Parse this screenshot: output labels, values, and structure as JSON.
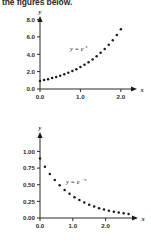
{
  "caption": {
    "text": "the figures below."
  },
  "figures": [
    {
      "id": "exp-growth",
      "y_axis_name": "y",
      "x_axis_name": "x",
      "equation_base": "y = e",
      "equation_exponent": "x"
    },
    {
      "id": "exp-decay",
      "y_axis_name": "y",
      "x_axis_name": "x",
      "equation_base": "y = e",
      "equation_exponent": "−x"
    }
  ],
  "chart_data": [
    {
      "type": "scatter",
      "title": "",
      "subtitle": "",
      "xlabel": "x",
      "ylabel": "y",
      "annotation": "y = e^x",
      "xlim": [
        0.0,
        2.3
      ],
      "ylim": [
        0.0,
        8.6
      ],
      "xticks": [
        0.0,
        1.0,
        2.0
      ],
      "xtick_labels": [
        "0.0",
        "1.0",
        "2.0"
      ],
      "yticks": [
        0.0,
        2.0,
        4.0,
        6.0,
        8.0
      ],
      "ytick_labels": [
        "0.0",
        "2.0",
        "4.0",
        "6.0",
        "8.0"
      ],
      "grid": false,
      "legend": "none",
      "marker": "circle",
      "marker_color": "#1b1b1b",
      "series": [
        {
          "name": "y = e^x",
          "x": [
            0.0,
            0.1,
            0.2,
            0.3,
            0.4,
            0.5,
            0.6,
            0.7,
            0.8,
            0.9,
            1.0,
            1.1,
            1.2,
            1.3,
            1.4,
            1.5,
            1.6,
            1.7,
            1.8,
            1.9,
            2.0
          ],
          "y": [
            1.0,
            1.11,
            1.22,
            1.35,
            1.49,
            1.65,
            1.82,
            2.01,
            2.23,
            2.46,
            2.72,
            3.0,
            3.32,
            3.67,
            4.06,
            4.48,
            4.95,
            5.47,
            6.05,
            6.69,
            7.39
          ]
        }
      ]
    },
    {
      "type": "scatter",
      "title": "",
      "subtitle": "",
      "xlabel": "x",
      "ylabel": "y",
      "annotation": "y = e^-x",
      "xlim": [
        0.0,
        2.85
      ],
      "ylim": [
        0.0,
        1.12
      ],
      "xticks": [
        0.0,
        1.0,
        2.0
      ],
      "xtick_labels": [
        "0.0",
        "1.0",
        "2.0"
      ],
      "yticks": [
        0.0,
        0.25,
        0.5,
        0.75,
        1.0
      ],
      "ytick_labels": [
        "0.00",
        "0.25",
        "0.50",
        "0.75",
        "1.00"
      ],
      "grid": false,
      "legend": "none",
      "marker": "circle",
      "marker_color": "#1b1b1b",
      "series": [
        {
          "name": "y = e^-x",
          "x": [
            0.0,
            0.15,
            0.3,
            0.45,
            0.6,
            0.75,
            0.9,
            1.05,
            1.2,
            1.35,
            1.5,
            1.65,
            1.8,
            1.95,
            2.1,
            2.25,
            2.4,
            2.55,
            2.7
          ],
          "y": [
            1.0,
            0.861,
            0.741,
            0.638,
            0.549,
            0.472,
            0.407,
            0.35,
            0.301,
            0.259,
            0.223,
            0.192,
            0.165,
            0.142,
            0.122,
            0.105,
            0.091,
            0.078,
            0.067
          ]
        }
      ]
    }
  ]
}
